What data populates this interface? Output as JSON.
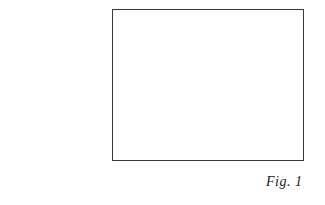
{
  "figure": {
    "caption": "Fig. 1",
    "frame_color": "#3a3a3a",
    "background": "#ffffff"
  }
}
